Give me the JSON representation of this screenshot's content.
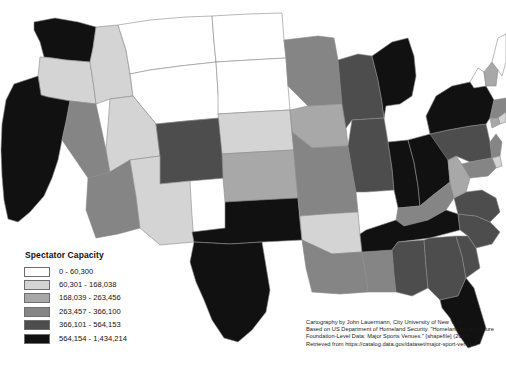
{
  "map": {
    "title": "Major Sports Venues Spectator Capacity by State",
    "projection": "Albers USA",
    "background_color": "#ffffff",
    "border_color": "#8a8a8a"
  },
  "legend": {
    "title": "Spectator Capacity",
    "classes": [
      {
        "label": "0 - 60,300",
        "color": "#ffffff",
        "min": 0,
        "max": 60300
      },
      {
        "label": "60,301 - 168,038",
        "color": "#d4d4d4",
        "min": 60301,
        "max": 168038
      },
      {
        "label": "168,039 - 263,456",
        "color": "#a8a8a8",
        "min": 168039,
        "max": 263456
      },
      {
        "label": "263,457 - 366,100",
        "color": "#858585",
        "min": 263457,
        "max": 366100
      },
      {
        "label": "366,101 - 564,153",
        "color": "#4d4d4d",
        "min": 366101,
        "max": 564153
      },
      {
        "label": "564,154 - 1,434,214",
        "color": "#111111",
        "min": 564154,
        "max": 1434214
      }
    ]
  },
  "attribution": {
    "lines": [
      "Cartography by John Lauermann, City University of New York.",
      "Based on US Department of Homeland Security. \"Homeland Infrastructure",
      "Foundation-Level Data: Major Sports Venues.\" [shapefile] (2015).",
      "Retrieved from https://catalog.data.gov/dataset/major-sport-venues"
    ]
  },
  "chart_data": {
    "type": "choropleth",
    "title": "Spectator Capacity",
    "value_field": "Spectator Capacity",
    "color_scale": [
      "#ffffff",
      "#d4d4d4",
      "#a8a8a8",
      "#858585",
      "#4d4d4d",
      "#111111"
    ],
    "class_breaks": [
      0,
      60300,
      168038,
      263456,
      366100,
      564153,
      1434214
    ],
    "states": [
      {
        "code": "WA",
        "name": "Washington",
        "class": 5
      },
      {
        "code": "OR",
        "name": "Oregon",
        "class": 1
      },
      {
        "code": "CA",
        "name": "California",
        "class": 5
      },
      {
        "code": "NV",
        "name": "Nevada",
        "class": 3
      },
      {
        "code": "ID",
        "name": "Idaho",
        "class": 1
      },
      {
        "code": "MT",
        "name": "Montana",
        "class": 0
      },
      {
        "code": "WY",
        "name": "Wyoming",
        "class": 0
      },
      {
        "code": "UT",
        "name": "Utah",
        "class": 1
      },
      {
        "code": "AZ",
        "name": "Arizona",
        "class": 3
      },
      {
        "code": "CO",
        "name": "Colorado",
        "class": 4
      },
      {
        "code": "NM",
        "name": "New Mexico",
        "class": 1
      },
      {
        "code": "ND",
        "name": "North Dakota",
        "class": 0
      },
      {
        "code": "SD",
        "name": "South Dakota",
        "class": 0
      },
      {
        "code": "NE",
        "name": "Nebraska",
        "class": 1
      },
      {
        "code": "KS",
        "name": "Kansas",
        "class": 2
      },
      {
        "code": "OK",
        "name": "Oklahoma",
        "class": 5
      },
      {
        "code": "TX",
        "name": "Texas",
        "class": 5
      },
      {
        "code": "MN",
        "name": "Minnesota",
        "class": 3
      },
      {
        "code": "IA",
        "name": "Iowa",
        "class": 2
      },
      {
        "code": "MO",
        "name": "Missouri",
        "class": 3
      },
      {
        "code": "AR",
        "name": "Arkansas",
        "class": 1
      },
      {
        "code": "LA",
        "name": "Louisiana",
        "class": 3
      },
      {
        "code": "WI",
        "name": "Wisconsin",
        "class": 4
      },
      {
        "code": "IL",
        "name": "Illinois",
        "class": 4
      },
      {
        "code": "MS",
        "name": "Mississippi",
        "class": 3
      },
      {
        "code": "MI",
        "name": "Michigan",
        "class": 5
      },
      {
        "code": "IN",
        "name": "Indiana",
        "class": 5
      },
      {
        "code": "OH",
        "name": "Ohio",
        "class": 5
      },
      {
        "code": "KY",
        "name": "Kentucky",
        "class": 3
      },
      {
        "code": "TN",
        "name": "Tennessee",
        "class": 5
      },
      {
        "code": "AL",
        "name": "Alabama",
        "class": 4
      },
      {
        "code": "GA",
        "name": "Georgia",
        "class": 4
      },
      {
        "code": "FL",
        "name": "Florida",
        "class": 5
      },
      {
        "code": "SC",
        "name": "South Carolina",
        "class": 4
      },
      {
        "code": "NC",
        "name": "North Carolina",
        "class": 4
      },
      {
        "code": "VA",
        "name": "Virginia",
        "class": 4
      },
      {
        "code": "WV",
        "name": "West Virginia",
        "class": 2
      },
      {
        "code": "PA",
        "name": "Pennsylvania",
        "class": 4
      },
      {
        "code": "NY",
        "name": "New York",
        "class": 5
      },
      {
        "code": "VT",
        "name": "Vermont",
        "class": 0
      },
      {
        "code": "NH",
        "name": "New Hampshire",
        "class": 2
      },
      {
        "code": "ME",
        "name": "Maine",
        "class": 0
      },
      {
        "code": "MA",
        "name": "Massachusetts",
        "class": 3
      },
      {
        "code": "RI",
        "name": "Rhode Island",
        "class": 1
      },
      {
        "code": "CT",
        "name": "Connecticut",
        "class": 2
      },
      {
        "code": "NJ",
        "name": "New Jersey",
        "class": 3
      },
      {
        "code": "DE",
        "name": "Delaware",
        "class": 1
      },
      {
        "code": "MD",
        "name": "Maryland",
        "class": 3
      }
    ]
  }
}
